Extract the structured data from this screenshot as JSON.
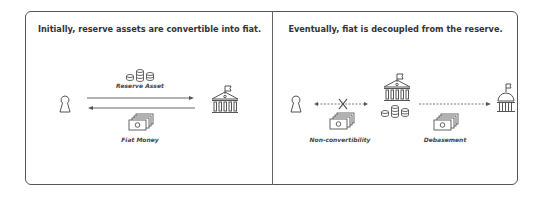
{
  "panels": [
    {
      "title": "Initially, reserve assets are convertible into fiat.",
      "labels": {
        "top": "Reserve Asset",
        "bottom": "Fiat Money"
      }
    },
    {
      "title": "Eventually, fiat is decoupled from the reserve.",
      "labels": {
        "left": "Non-convertibility",
        "right": "Debasement"
      }
    }
  ],
  "icons": {
    "person": "person-icon",
    "bank": "bank-building-icon",
    "coins": "coin-stack-icon",
    "cash": "banknotes-icon",
    "capitol": "capitol-dome-icon",
    "cross": "x-mark-icon"
  },
  "colors": {
    "stroke": "#555555",
    "text": "#333333",
    "background": "#ffffff"
  }
}
